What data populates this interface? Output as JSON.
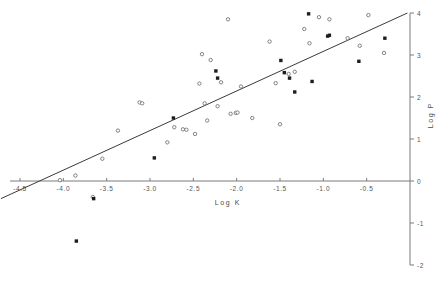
{
  "chart_data": {
    "type": "scatter",
    "title": "",
    "xlabel": "Log K",
    "ylabel": "Log P",
    "xlim": [
      -4.75,
      0.1
    ],
    "ylim": [
      -2,
      4
    ],
    "grid": false,
    "legend": "none",
    "xticks": [
      -4.5,
      -4.0,
      -3.5,
      -3.0,
      -2.5,
      -2.0,
      -1.5,
      -1.0,
      -0.5
    ],
    "xtick_labels": [
      "-4.5",
      "-4.0",
      "-3.5",
      "-3.0",
      "-2.5",
      "-2.0",
      "-1.5",
      "-1.0",
      "-0.5"
    ],
    "yticks": [
      -2,
      -1,
      0,
      1,
      2,
      3,
      4
    ],
    "ytick_labels": [
      "-2",
      "-1",
      "0",
      "1",
      "2",
      "3",
      "4"
    ],
    "yaxis_position": "right",
    "xaxis_position": "zero",
    "fit_line": {
      "label": "regression line",
      "x_start": -4.72,
      "y_start": -0.42,
      "x_end": -0.03,
      "y_end": 4.0,
      "slope": 0.942,
      "intercept": 4.03
    },
    "series": [
      {
        "name": "open markers",
        "marker": "open-circle",
        "color": "#767676",
        "points": [
          [
            -4.04,
            0.02
          ],
          [
            -3.86,
            0.13
          ],
          [
            -3.66,
            -0.38
          ],
          [
            -3.55,
            0.53
          ],
          [
            -3.37,
            1.2
          ],
          [
            -3.12,
            1.87
          ],
          [
            -3.09,
            1.85
          ],
          [
            -2.8,
            0.92
          ],
          [
            -2.72,
            1.28
          ],
          [
            -2.62,
            1.23
          ],
          [
            -2.58,
            1.22
          ],
          [
            -2.48,
            1.12
          ],
          [
            -2.43,
            2.32
          ],
          [
            -2.4,
            3.02
          ],
          [
            -2.37,
            1.85
          ],
          [
            -2.34,
            1.44
          ],
          [
            -2.3,
            2.88
          ],
          [
            -2.22,
            1.78
          ],
          [
            -2.18,
            2.35
          ],
          [
            -2.1,
            3.85
          ],
          [
            -2.07,
            1.6
          ],
          [
            -2.01,
            1.62
          ],
          [
            -1.99,
            1.63
          ],
          [
            -1.95,
            2.25
          ],
          [
            -1.82,
            1.5
          ],
          [
            -1.62,
            3.32
          ],
          [
            -1.55,
            2.33
          ],
          [
            -1.5,
            1.35
          ],
          [
            -1.4,
            2.55
          ],
          [
            -1.33,
            2.6
          ],
          [
            -1.22,
            3.62
          ],
          [
            -1.16,
            3.28
          ],
          [
            -1.05,
            3.9
          ],
          [
            -0.93,
            3.85
          ],
          [
            -0.72,
            3.4
          ],
          [
            -0.58,
            3.22
          ],
          [
            -0.48,
            3.95
          ],
          [
            -0.3,
            3.05
          ]
        ]
      },
      {
        "name": "filled markers",
        "marker": "filled-square",
        "color": "#1d1d1d",
        "points": [
          [
            -3.65,
            -0.42
          ],
          [
            -2.95,
            0.55
          ],
          [
            -2.73,
            1.5
          ],
          [
            -2.24,
            2.62
          ],
          [
            -2.22,
            2.45
          ],
          [
            -1.49,
            2.87
          ],
          [
            -1.45,
            2.58
          ],
          [
            -1.39,
            2.45
          ],
          [
            -1.33,
            2.12
          ],
          [
            -1.17,
            3.98
          ],
          [
            -1.13,
            2.37
          ],
          [
            -0.95,
            3.45
          ],
          [
            -0.93,
            3.47
          ],
          [
            -0.59,
            2.85
          ],
          [
            -0.29,
            3.4
          ],
          [
            -3.85,
            -1.43
          ]
        ]
      }
    ]
  },
  "axes": {
    "x_title": "Log K",
    "y_title": "Log P"
  }
}
